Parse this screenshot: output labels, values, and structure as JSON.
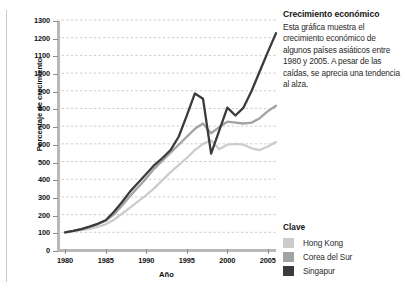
{
  "panel": {
    "title": "Crecimiento económico",
    "body": "Esta gráfica muestra el crecimiento económico de algunos países asiáticos entre 1980 y 2005. A pesar de las caídas, se aprecia una tendencia al alza."
  },
  "legend": {
    "title": "Clave",
    "items": [
      {
        "label": "Hong Kong",
        "color": "#cccccc"
      },
      {
        "label": "Corea del Sur",
        "color": "#a3a3a3"
      },
      {
        "label": "Singapur",
        "color": "#3b3b3b"
      }
    ]
  },
  "chart_data": {
    "type": "line",
    "title": "",
    "xlabel": "Año",
    "ylabel": "Porcentaje de crecimiento",
    "xlim": [
      1979,
      2006
    ],
    "ylim": [
      0,
      1300
    ],
    "ytick_step": 100,
    "yticks": [
      0,
      100,
      200,
      300,
      400,
      500,
      600,
      700,
      800,
      900,
      1000,
      1100,
      1200,
      1300
    ],
    "xticks": [
      1980,
      1985,
      1990,
      1995,
      2000,
      2005
    ],
    "grid": "horizontal-dashed",
    "legend_position": "right",
    "x": [
      1980,
      1981,
      1982,
      1983,
      1984,
      1985,
      1986,
      1987,
      1988,
      1989,
      1990,
      1991,
      1992,
      1993,
      1994,
      1995,
      1996,
      1997,
      1998,
      1999,
      2000,
      2001,
      2002,
      2003,
      2004,
      2005,
      2006
    ],
    "series": [
      {
        "name": "Hong Kong",
        "color": "#cccccc",
        "values": [
          100,
          105,
          112,
          120,
          130,
          145,
          170,
          205,
          240,
          275,
          310,
          350,
          395,
          440,
          480,
          520,
          565,
          600,
          620,
          570,
          595,
          600,
          595,
          575,
          565,
          585,
          610
        ]
      },
      {
        "name": "Corea del Sur",
        "color": "#a3a3a3",
        "values": [
          100,
          108,
          118,
          130,
          145,
          165,
          200,
          250,
          305,
          355,
          405,
          460,
          505,
          550,
          595,
          640,
          685,
          715,
          660,
          695,
          725,
          720,
          715,
          720,
          745,
          785,
          815
        ]
      },
      {
        "name": "Singapur",
        "color": "#3b3b3b",
        "values": [
          100,
          108,
          118,
          132,
          148,
          168,
          215,
          270,
          330,
          380,
          430,
          480,
          520,
          565,
          640,
          760,
          885,
          855,
          545,
          675,
          805,
          760,
          805,
          900,
          1010,
          1120,
          1225
        ]
      }
    ]
  }
}
